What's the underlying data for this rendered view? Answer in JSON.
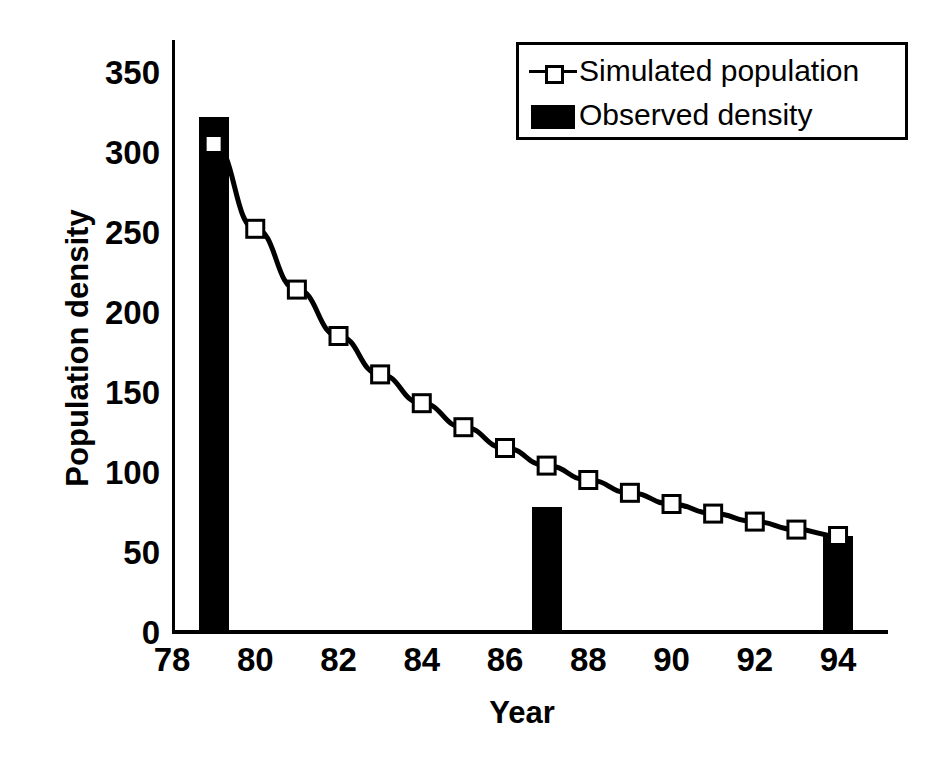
{
  "chart_data": {
    "type": "line",
    "title": "",
    "xlabel": "Year",
    "ylabel": "Population density",
    "xlim": [
      78,
      95.2
    ],
    "ylim": [
      0,
      350
    ],
    "ytick_values": [
      0,
      50,
      100,
      150,
      200,
      250,
      300,
      350
    ],
    "ytick_labels": [
      "0",
      "50",
      "100",
      "150",
      "200",
      "250",
      "300",
      "350"
    ],
    "xtick_values": [
      78,
      80,
      82,
      84,
      86,
      88,
      90,
      92,
      94
    ],
    "xtick_labels": [
      "78",
      "80",
      "82",
      "84",
      "86",
      "88",
      "90",
      "92",
      "94"
    ],
    "grid": false,
    "legend_position": "top-right",
    "series": [
      {
        "name": "Simulated population",
        "type": "line",
        "marker": "open-square",
        "color": "#000000",
        "x": [
          79,
          80,
          81,
          82,
          83,
          84,
          85,
          86,
          87,
          88,
          89,
          90,
          91,
          92,
          93,
          94
        ],
        "values": [
          305,
          252,
          214,
          185,
          161,
          143,
          128,
          115,
          104,
          95,
          87,
          80,
          74,
          69,
          64,
          60
        ]
      },
      {
        "name": "Observed density",
        "type": "bar",
        "color": "#000000",
        "x": [
          79,
          87,
          94
        ],
        "values": [
          322,
          78,
          60
        ]
      }
    ]
  },
  "legend": {
    "entries": [
      {
        "label": "Simulated population",
        "icon": "line-with-open-square-marker"
      },
      {
        "label": "Observed density",
        "icon": "filled-black-bar"
      }
    ]
  }
}
